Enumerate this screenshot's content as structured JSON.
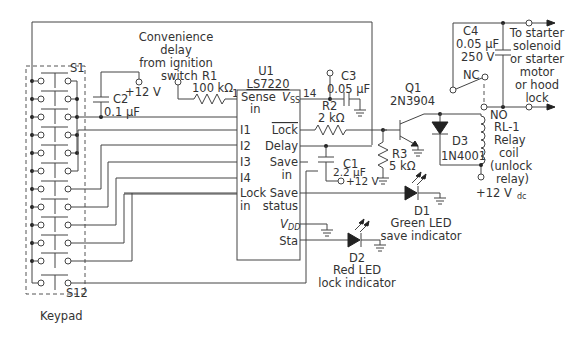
{
  "diagram": {
    "keypad": {
      "label": "Keypad",
      "first_switch": "S1",
      "last_switch": "S12",
      "switch_count": 12
    },
    "convenience_note": {
      "line1": "Convenience",
      "line2": "delay",
      "line3": "from ignition",
      "line4": "switch"
    },
    "u1": {
      "ref": "U1",
      "part": "LS7220",
      "pin1": "1",
      "pin14": "14",
      "pins_left": {
        "sense": "Sense",
        "sense2": "in",
        "i1": "I1",
        "i2": "I2",
        "i3": "I3",
        "i4": "I4",
        "lock_in": "Lock",
        "lock_in2": "in"
      },
      "pins_right": {
        "vss": "V",
        "vss_sub": "SS",
        "lock": "Lock",
        "delay": "Delay",
        "save_in": "Save",
        "save_in2": "in",
        "save_status": "Save",
        "save_status2": "status",
        "vdd": "V",
        "vdd_sub": "DD",
        "sta": "Sta"
      }
    },
    "components": {
      "r1": {
        "ref": "R1",
        "value": "100 kΩ"
      },
      "r2": {
        "ref": "R2",
        "value": "2 kΩ"
      },
      "r3": {
        "ref": "R3",
        "value": "5 kΩ"
      },
      "c1": {
        "ref": "C1",
        "value": "2.2 μF"
      },
      "c2": {
        "ref": "C2",
        "value": "0.1 μF"
      },
      "c3": {
        "ref": "C3",
        "value": "0.05 μF"
      },
      "c4": {
        "ref": "C4",
        "value": "0.05 μF",
        "rating": "250 V"
      },
      "q1": {
        "ref": "Q1",
        "part": "2N3904"
      },
      "d1": {
        "ref": "D1",
        "desc1": "Green LED",
        "desc2": "save indicator"
      },
      "d2": {
        "ref": "D2",
        "desc1": "Red LED",
        "desc2": "lock indicator"
      },
      "d3": {
        "ref": "D3",
        "part": "1N4001"
      },
      "rl1": {
        "ref": "RL-1",
        "line1": "Relay",
        "line2": "coil",
        "line3": "(unlock",
        "line4": "relay)",
        "nc": "NC",
        "no": "NO"
      }
    },
    "supplies": {
      "v12_c2": "+12 V",
      "v12_c1": "+12 V",
      "v12_dc": "+12 V",
      "v12_dc_sub": "dc"
    },
    "output_note": {
      "line1": "To starter",
      "line2": "solenoid",
      "line3": "or starter",
      "line4": "motor",
      "line5": "or hood",
      "line6": "lock"
    }
  }
}
